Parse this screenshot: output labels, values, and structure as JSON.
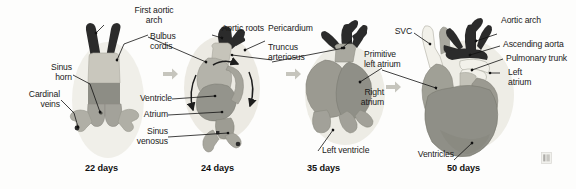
{
  "figure": {
    "background": "#fdfdfc"
  },
  "palette": {
    "outflow_dark": "#2b2b2b",
    "bulbus_light": "#c9c7bd",
    "ventricle_mid": "#8f8f87",
    "body_gray": "#9a9a92",
    "body_gray_light": "#b3b2a9",
    "pericardium_halo": "#e8e7e0",
    "vessel_white": "#f2f1ea",
    "arrow_gray": "#c6c5bd",
    "leader_line": "#111111",
    "text": "#1a1a1a"
  },
  "panels": [
    {
      "id": "panel-22-days",
      "stage_label": "22 days",
      "labels": [
        {
          "id": "first-aortic-arch",
          "text": "First aortic\narch",
          "align": "right"
        },
        {
          "id": "bulbus-cordis",
          "text": "Bulbus\ncordis",
          "align": "left"
        },
        {
          "id": "sinus-horn",
          "text": "Sinus\nhorn",
          "align": "right"
        },
        {
          "id": "cardinal-veins",
          "text": "Cardinal\nveins",
          "align": "right"
        }
      ]
    },
    {
      "id": "panel-24-days",
      "stage_label": "24 days",
      "labels": [
        {
          "id": "aortic-roots",
          "text": "Aortic roots",
          "align": "right"
        },
        {
          "id": "pericardium",
          "text": "Pericardium",
          "align": "left"
        },
        {
          "id": "truncus-arteriosus",
          "text": "Truncus\narteriosus",
          "align": "left"
        },
        {
          "id": "ventricle",
          "text": "Ventricle",
          "align": "right"
        },
        {
          "id": "atrium",
          "text": "Atrium",
          "align": "right"
        },
        {
          "id": "sinus-venosus",
          "text": "Sinus\nvenosus",
          "align": "right"
        }
      ]
    },
    {
      "id": "panel-35-days",
      "stage_label": "35 days",
      "labels": [
        {
          "id": "primitive-left-atrium",
          "text": "Primitive\nleft atrium",
          "align": "left"
        },
        {
          "id": "left-ventricle",
          "text": "Left ventricle",
          "align": "left"
        }
      ]
    },
    {
      "id": "panel-50-days",
      "stage_label": "50 days",
      "labels": [
        {
          "id": "svc",
          "text": "SVC",
          "align": "right"
        },
        {
          "id": "right-atrium",
          "text": "Right\natrium",
          "align": "right"
        },
        {
          "id": "aortic-arch",
          "text": "Aortic arch",
          "align": "left"
        },
        {
          "id": "ascending-aorta",
          "text": "Ascending aorta",
          "align": "left"
        },
        {
          "id": "pulmonary-trunk",
          "text": "Pulmonary trunk",
          "align": "left"
        },
        {
          "id": "left-atrium",
          "text": "Left\natrium",
          "align": "left"
        },
        {
          "id": "ventricles",
          "text": "Ventricles",
          "align": "right"
        }
      ]
    }
  ],
  "transition_arrows": [
    {
      "id": "arrow-22-to-24"
    },
    {
      "id": "arrow-24-to-35"
    },
    {
      "id": "arrow-35-to-50"
    }
  ],
  "loop_arrows": [
    {
      "id": "loop-arrow-left"
    },
    {
      "id": "loop-arrow-right"
    },
    {
      "id": "loop-arrow-top"
    }
  ]
}
